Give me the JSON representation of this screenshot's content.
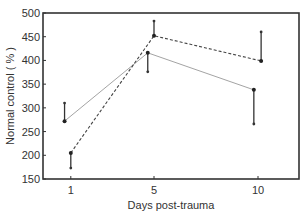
{
  "chart_data": {
    "type": "line",
    "title": "",
    "xlabel": "Days post-trauma",
    "ylabel": "Normal control ( % )",
    "x": [
      1,
      5,
      10
    ],
    "xticks": [
      "1",
      "5",
      "10"
    ],
    "yticks": [
      "150",
      "200",
      "250",
      "300",
      "350",
      "400",
      "450",
      "500"
    ],
    "ylim": [
      150,
      500
    ],
    "xlim": [
      0.3,
      12
    ],
    "grid": false,
    "legend": null,
    "series": [
      {
        "name": "solid",
        "style": "solid",
        "color": "#999999",
        "x": [
          0.7,
          4.7,
          9.8
        ],
        "values": [
          272,
          416,
          338
        ],
        "error_end": [
          310,
          376,
          266
        ]
      },
      {
        "name": "dashed",
        "style": "dashed",
        "color": "#444444",
        "x": [
          1.0,
          5.0,
          10.15
        ],
        "values": [
          205,
          452,
          399
        ],
        "error_end": [
          173,
          483,
          460
        ]
      }
    ]
  }
}
